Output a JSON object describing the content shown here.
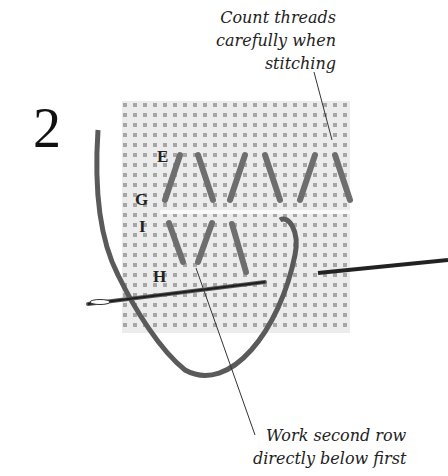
{
  "step_number": "2",
  "captions": {
    "top": [
      "Count threads",
      "carefully when",
      "stitching"
    ],
    "bottom": [
      "Work second row",
      "directly below first"
    ]
  },
  "point_labels": {
    "E": "E",
    "G": "G",
    "I": "I",
    "H": "H"
  },
  "colors": {
    "fabric": "#e9e9e9",
    "fabric_holes": "#9a9a9a",
    "stitch": "#6e6e6e",
    "thread": "#5a5a5a",
    "needle": "#2a2a2a",
    "leader": "#333333"
  }
}
